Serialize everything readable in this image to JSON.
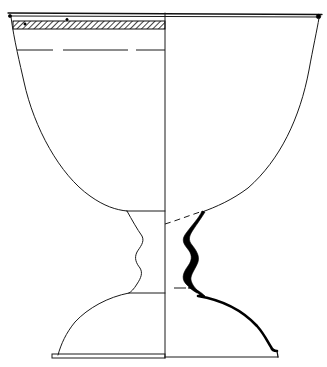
{
  "figure": {
    "type": "archaeological profile drawing",
    "left_half": "exterior elevation with surface band",
    "right_half": "cross-section profile",
    "colors": {
      "line": "#1a1a1a",
      "section_fill": "#000000",
      "background": "#ffffff"
    }
  }
}
